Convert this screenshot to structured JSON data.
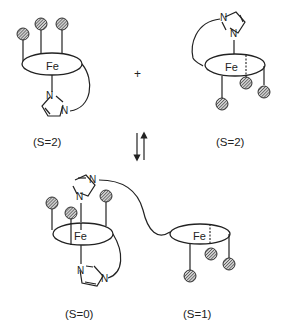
{
  "diagram": {
    "type": "spin-state equilibrium of iron porphyrin with tethered imidazole",
    "operator": "+",
    "equilibrium_arrows": "forward-reverse",
    "metal_label": "Fe",
    "ring_atom_label": "N",
    "species": [
      {
        "id": "top-left",
        "spin_label": "(S=2)",
        "description": "Fe porphyrin, three pickets up, proximal imidazole tethered below"
      },
      {
        "id": "top-right",
        "spin_label": "(S=2)",
        "description": "Fe porphyrin, imidazole tethered above, three pickets down"
      },
      {
        "id": "bottom-left",
        "spin_label": "(S=0)",
        "description": "Fe porphyrin with two axial imidazoles (six-coordinate)"
      },
      {
        "id": "bottom-right",
        "spin_label": "(S=1)",
        "description": "Fe porphyrin, four-coordinate, imidazole tether donated"
      }
    ]
  }
}
